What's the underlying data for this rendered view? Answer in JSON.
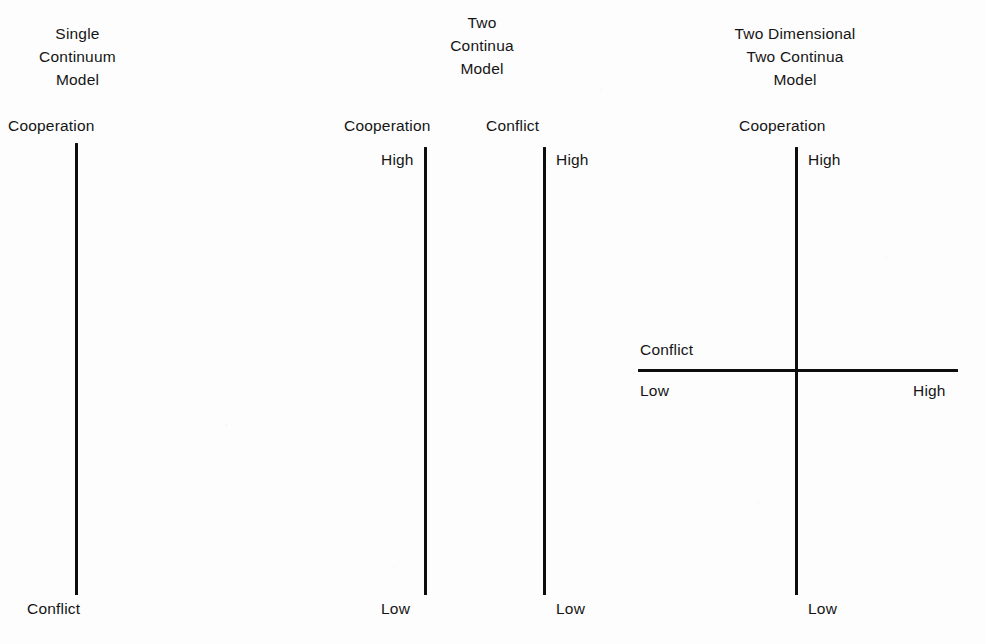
{
  "figure": {
    "background_color": "#fdfdfd",
    "line_color": "#0d0d0d",
    "text_color": "#151515"
  },
  "models": [
    {
      "id": "single-continuum",
      "title_lines": [
        "Single",
        "Continuum",
        "Model"
      ],
      "axes": [
        {
          "id": "cooperation-conflict-axis",
          "orientation": "vertical",
          "name": "Cooperation",
          "top_label": "Cooperation",
          "bottom_label": "Conflict"
        }
      ]
    },
    {
      "id": "two-continua",
      "title_lines": [
        "Two",
        "Continua",
        "Model"
      ],
      "axes": [
        {
          "id": "cooperation-axis",
          "orientation": "vertical",
          "name": "Cooperation",
          "top_label": "High",
          "bottom_label": "Low"
        },
        {
          "id": "conflict-axis",
          "orientation": "vertical",
          "name": "Conflict",
          "top_label": "High",
          "bottom_label": "Low"
        }
      ]
    },
    {
      "id": "two-dimensional-two-continua",
      "title_lines": [
        "Two Dimensional",
        "Two Continua",
        "Model"
      ],
      "axes": [
        {
          "id": "cooperation-axis",
          "orientation": "vertical",
          "name": "Cooperation",
          "top_label": "High",
          "bottom_label": "Low"
        },
        {
          "id": "conflict-axis",
          "orientation": "horizontal",
          "name": "Conflict",
          "left_label": "Low",
          "right_label": "High"
        }
      ]
    }
  ],
  "m1": {
    "title_1": "Single",
    "title_2": "Continuum",
    "title_3": "Model",
    "axis_name": "Cooperation",
    "bottom_label": "Conflict"
  },
  "m2": {
    "title_1": "Two",
    "title_2": "Continua",
    "title_3": "Model",
    "axis_a_name": "Cooperation",
    "axis_a_top": "High",
    "axis_a_bottom": "Low",
    "axis_b_name": "Conflict",
    "axis_b_top": "High",
    "axis_b_bottom": "Low"
  },
  "m3": {
    "title_1": "Two Dimensional",
    "title_2": "Two Continua",
    "title_3": "Model",
    "vaxis_name": "Cooperation",
    "vaxis_top": "High",
    "vaxis_bottom": "Low",
    "haxis_name": "Conflict",
    "haxis_left": "Low",
    "haxis_right": "High"
  }
}
